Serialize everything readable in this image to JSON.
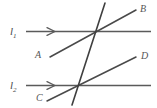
{
  "figure": {
    "type": "geometry-diagram",
    "width": 157,
    "height": 108,
    "background_color": "#ffffff",
    "stroke_color": "#4f4f4f",
    "label_color": "#4a4a4a",
    "labels": {
      "line1": "l",
      "line1_sub": "1",
      "line2": "l",
      "line2_sub": "2",
      "point_a": "A",
      "point_b": "B",
      "point_c": "C",
      "point_d": "D"
    },
    "geometry": {
      "parallel_lines": [
        {
          "name": "l1",
          "x1": 26,
          "y1": 31,
          "x2": 151,
          "y2": 31,
          "arrow_at_x": 53
        },
        {
          "name": "l2",
          "x1": 26,
          "y1": 85,
          "x2": 151,
          "y2": 85,
          "arrow_at_x": 53
        }
      ],
      "transversals": [
        {
          "name": "AB",
          "x1": 50,
          "y1": 57,
          "x2": 136,
          "y2": 10
        },
        {
          "name": "CD",
          "x1": 48,
          "y1": 101,
          "x2": 136,
          "y2": 58
        },
        {
          "name": "steep",
          "x1": 105,
          "y1": 3,
          "x2": 73,
          "y2": 104
        }
      ],
      "intersections": [
        {
          "x": 96,
          "y": 31
        },
        {
          "x": 79,
          "y": 85
        }
      ]
    }
  }
}
